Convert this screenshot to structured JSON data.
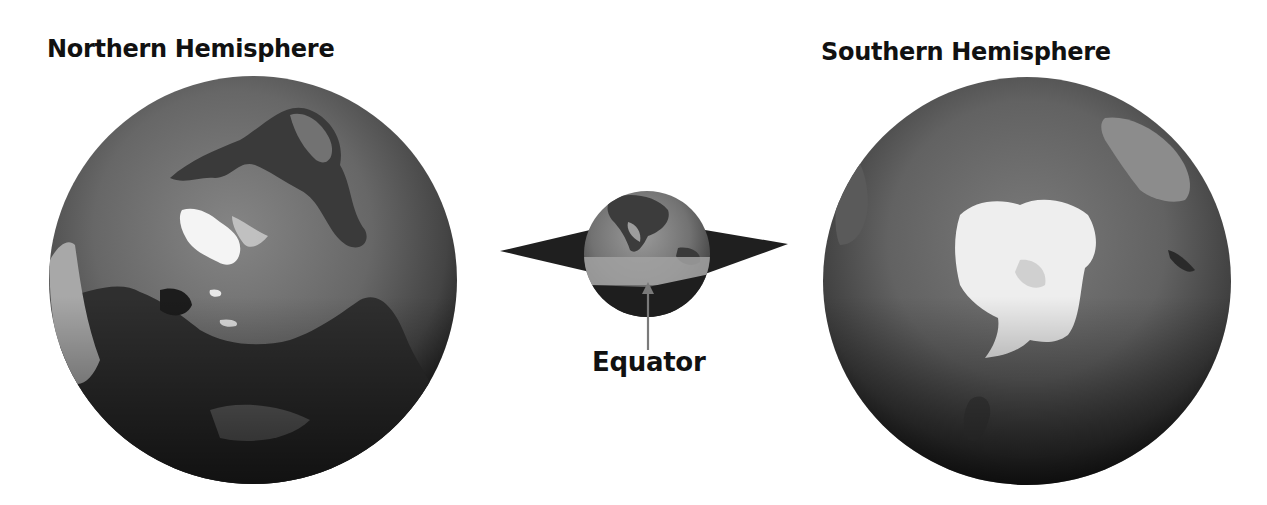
{
  "figure": {
    "northern": {
      "title": "Northern Hemisphere",
      "view": "north-pole-globe"
    },
    "southern": {
      "title": "Southern Hemisphere",
      "view": "south-pole-globe"
    },
    "center": {
      "label": "Equator",
      "view": "globe-with-equatorial-plane"
    },
    "colors": {
      "ocean": "#6b6b6b",
      "limb": "#1c1c1c",
      "ice": "#f2f2f2",
      "land_dark": "#2e2e2e",
      "plane": "#1f1f1f",
      "equator_band": "#9a9a9a",
      "text": "#111111",
      "arrow": "#7a7a7a"
    }
  }
}
